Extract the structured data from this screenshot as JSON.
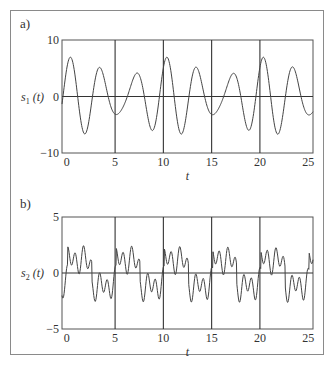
{
  "chart_data": [
    {
      "panel_label": "a)",
      "type": "line",
      "title": "",
      "xlabel": "t",
      "ylabel": "s1 (t)",
      "ylabel_main": "s",
      "ylabel_sub": "1",
      "ylabel_tail": " (t)",
      "xlim": [
        -0.5,
        25.5
      ],
      "ylim": [
        -10,
        10
      ],
      "xticks": [
        0,
        5,
        10,
        15,
        20,
        25
      ],
      "xtick_labels": [
        "0",
        "5",
        "10",
        "15",
        "20",
        "25"
      ],
      "yticks": [
        -10,
        0,
        10
      ],
      "ytick_labels": [
        "−10",
        "0",
        "10"
      ],
      "vertical_gridlines": [
        5,
        10,
        15,
        20
      ],
      "zero_line": true,
      "legend": null,
      "series": [
        {
          "name": "s1(t)",
          "description": "sum of two sinusoids (beat pattern), envelope varies between ~3 and ~7",
          "components": [
            {
              "amplitude": 5,
              "period": 3.33,
              "phase": 0.95
            },
            {
              "amplitude": 2,
              "period": 2.5,
              "phase": 0.5
            }
          ],
          "x": [
            -0.5,
            0,
            0.3,
            1.9,
            3.5,
            5,
            6.8,
            8.4,
            9.9,
            11.1,
            12.5,
            14.5,
            16.1,
            17.8,
            19.5,
            21.2,
            22.7,
            24.2,
            25.5
          ],
          "values": [
            3.5,
            4.8,
            5.1,
            -6.3,
            7.0,
            -6.3,
            5.0,
            -3.8,
            3.0,
            -3.7,
            5.0,
            -6.7,
            7.0,
            -6.5,
            5.0,
            -3.8,
            3.0,
            -3.8,
            2.0
          ]
        }
      ]
    },
    {
      "panel_label": "b)",
      "type": "line",
      "title": "",
      "xlabel": "t",
      "ylabel": "s2 (t)",
      "ylabel_main": "s",
      "ylabel_sub": "2",
      "ylabel_tail": " (t)",
      "xlim": [
        -0.5,
        25.5
      ],
      "ylim": [
        -5,
        5
      ],
      "xticks": [
        0,
        5,
        10,
        15,
        20,
        25
      ],
      "xtick_labels": [
        "0",
        "5",
        "10",
        "15",
        "20",
        "25"
      ],
      "yticks": [
        -5,
        0,
        5
      ],
      "ytick_labels": [
        "−5",
        "0",
        "5"
      ],
      "vertical_gridlines": [
        5,
        10,
        15,
        20
      ],
      "zero_line": true,
      "legend": null,
      "series": [
        {
          "name": "s2(t)",
          "description": "square-wave-like signal with superimposed high-frequency ripple, period ~5",
          "components": [
            {
              "amplitude": 2.0,
              "period": 5.0,
              "phase": 0.3
            },
            {
              "amplitude": 0.9,
              "period": 0.83,
              "phase": 1.2
            },
            {
              "amplitude": 0.5,
              "period": 1.67,
              "phase": 0.6
            }
          ],
          "x": [
            -0.5,
            0,
            0.6,
            0.9,
            1.4,
            1.9,
            2.4,
            2.8,
            3.3,
            3.9,
            4.4,
            4.9,
            5.4,
            6.0,
            6.4,
            6.9,
            7.5,
            8.0,
            8.6,
            9.2,
            9.7
          ],
          "values": [
            2.8,
            2.7,
            0.4,
            1.2,
            -2.0,
            -1.0,
            -2.5,
            0.6,
            0.4,
            2.9,
            1.0,
            1.7,
            -1.7,
            -1.0,
            -2.7,
            0.0,
            -0.3,
            2.8,
            1.8,
            2.4,
            -1.0
          ]
        }
      ]
    }
  ]
}
